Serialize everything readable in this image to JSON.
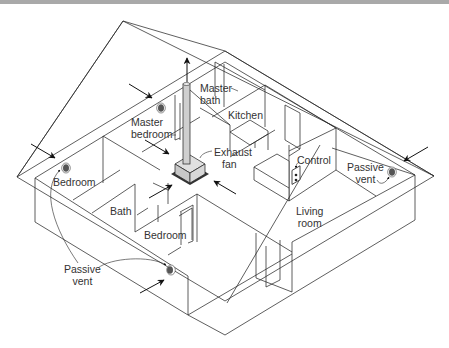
{
  "diagram": {
    "type": "isometric-house-ventilation",
    "labels": {
      "master_bath_1": "Master",
      "master_bath_2": "bath",
      "master_bedroom_1": "Master",
      "master_bedroom_2": "bedroom",
      "kitchen": "Kitchen",
      "exhaust_fan_1": "Exhaust",
      "exhaust_fan_2": "fan",
      "control": "Control",
      "passive_vent_right_1": "Passive",
      "passive_vent_right_2": "vent",
      "bedroom_left": "Bedroom",
      "bath": "Bath",
      "bedroom_bottom": "Bedroom",
      "living_room_1": "Living",
      "living_room_2": "room",
      "passive_vent_left_1": "Passive",
      "passive_vent_left_2": "vent"
    },
    "colors": {
      "line": "#2a2a2a",
      "vent_fill": "#555555",
      "fan_box": "#d4d4d4",
      "topbar": "#a9a9a9"
    }
  }
}
